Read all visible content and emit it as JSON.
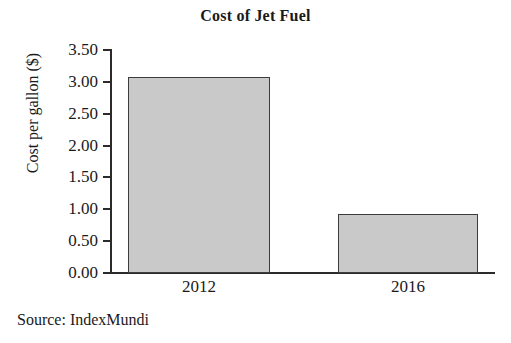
{
  "chart_data": {
    "type": "bar",
    "title": "Cost of Jet Fuel",
    "xlabel": "",
    "ylabel": "Cost per gallon ($)",
    "categories": [
      "2012",
      "2016"
    ],
    "values": [
      3.07,
      0.93
    ],
    "ylim": [
      0.0,
      3.5
    ],
    "ytick_labels": [
      "3.50",
      "3.00",
      "2.50",
      "2.00",
      "1.50",
      "1.00",
      "0.50",
      "0.00"
    ],
    "ytick_values": [
      3.5,
      3.0,
      2.5,
      2.0,
      1.5,
      1.0,
      0.5,
      0.0
    ],
    "grid": false,
    "legend": "none",
    "bar_fill_color": "#c9c9c9",
    "bar_border_color": "#3c3c3c",
    "axis_color": "#2b2b2b",
    "background_color": "#ffffff",
    "source": "Source: IndexMundi"
  }
}
